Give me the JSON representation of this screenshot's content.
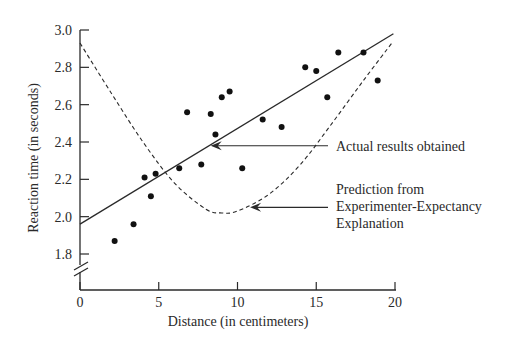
{
  "chart_data": {
    "type": "scatter",
    "title": "",
    "xlabel": "Distance (in centimeters)",
    "ylabel": "Reaction time (in seconds)",
    "xlim": [
      0,
      20
    ],
    "ylim": [
      1.8,
      3.0
    ],
    "y_axis_break": true,
    "grid": false,
    "x_ticks": [
      0,
      5,
      10,
      15,
      20
    ],
    "x_tick_labels": [
      "0",
      "5",
      "10",
      "15",
      "20"
    ],
    "y_ticks": [
      1.8,
      2.0,
      2.2,
      2.4,
      2.6,
      2.8,
      3.0
    ],
    "y_tick_labels": [
      "1.8",
      "2.0",
      "2.2",
      "2.4",
      "2.6",
      "2.8",
      "3.0"
    ],
    "points": [
      {
        "x": 2.2,
        "y": 1.87
      },
      {
        "x": 3.4,
        "y": 1.96
      },
      {
        "x": 4.1,
        "y": 2.21
      },
      {
        "x": 4.5,
        "y": 2.11
      },
      {
        "x": 4.8,
        "y": 2.23
      },
      {
        "x": 6.3,
        "y": 2.26
      },
      {
        "x": 6.8,
        "y": 2.56
      },
      {
        "x": 7.7,
        "y": 2.28
      },
      {
        "x": 8.3,
        "y": 2.55
      },
      {
        "x": 8.6,
        "y": 2.44
      },
      {
        "x": 9.0,
        "y": 2.64
      },
      {
        "x": 9.5,
        "y": 2.67
      },
      {
        "x": 10.3,
        "y": 2.26
      },
      {
        "x": 11.6,
        "y": 2.52
      },
      {
        "x": 12.8,
        "y": 2.48
      },
      {
        "x": 14.3,
        "y": 2.8
      },
      {
        "x": 15.0,
        "y": 2.78
      },
      {
        "x": 15.7,
        "y": 2.64
      },
      {
        "x": 16.4,
        "y": 2.88
      },
      {
        "x": 18.0,
        "y": 2.88
      },
      {
        "x": 18.9,
        "y": 2.73
      }
    ],
    "series": [
      {
        "name": "Actual results obtained",
        "style": "solid-line",
        "points": [
          {
            "x": 0,
            "y": 1.96
          },
          {
            "x": 19.9,
            "y": 2.98
          }
        ]
      },
      {
        "name": "Prediction from Experimenter-Expectancy Explanation",
        "style": "dashed-curve",
        "points": [
          {
            "x": 0,
            "y": 2.93
          },
          {
            "x": 2,
            "y": 2.66
          },
          {
            "x": 4,
            "y": 2.4
          },
          {
            "x": 6,
            "y": 2.18
          },
          {
            "x": 8,
            "y": 2.04
          },
          {
            "x": 9,
            "y": 2.02
          },
          {
            "x": 10,
            "y": 2.03
          },
          {
            "x": 12,
            "y": 2.12
          },
          {
            "x": 14,
            "y": 2.28
          },
          {
            "x": 16,
            "y": 2.5
          },
          {
            "x": 18,
            "y": 2.73
          },
          {
            "x": 19.8,
            "y": 2.93
          }
        ]
      }
    ],
    "annotations": [
      {
        "target": "Actual results obtained",
        "lines": [
          "Actual results obtained"
        ],
        "arrow_to": {
          "x": 8.3,
          "y": 2.38
        }
      },
      {
        "target": "Prediction from Experimenter-Expectancy Explanation",
        "lines": [
          "Prediction from",
          "Experimenter-Expectancy",
          "Explanation"
        ],
        "arrow_to": {
          "x": 10.8,
          "y": 2.05
        }
      }
    ]
  },
  "colors": {
    "ink": "#2a2a2a",
    "background": "#ffffff"
  }
}
